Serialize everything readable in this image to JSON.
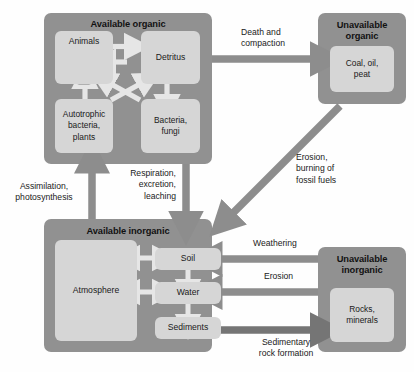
{
  "diagram": {
    "colors": {
      "group_fill": "#919191",
      "node_fill": "#d6d6d6",
      "arrow_gray": "#8d8d8d",
      "arrow_light": "#e2e2e2",
      "arrow_dark": "#6e6e6e",
      "text": "#1a1a1a",
      "background": "#fefefe"
    },
    "groups": [
      {
        "id": "available-organic",
        "title": "Available organic",
        "nodes": [
          {
            "id": "animals",
            "label": "Animals",
            "has_loop_arrow": true
          },
          {
            "id": "detritus",
            "label": "Detritus"
          },
          {
            "id": "autotrophic",
            "label": "Autotrophic\nbacteria,\nplants"
          },
          {
            "id": "bacteria-fungi",
            "label": "Bacteria,\nfungi"
          }
        ]
      },
      {
        "id": "unavailable-organic",
        "title": "Unavailable\norganic",
        "nodes": [
          {
            "id": "coal-oil-peat",
            "label": "Coal, oil,\npeat"
          }
        ]
      },
      {
        "id": "available-inorganic",
        "title": "Available inorganic",
        "nodes": [
          {
            "id": "atmosphere",
            "label": "Atmosphere"
          },
          {
            "id": "soil",
            "label": "Soil"
          },
          {
            "id": "water",
            "label": "Water"
          },
          {
            "id": "sediments",
            "label": "Sediments"
          }
        ]
      },
      {
        "id": "unavailable-inorganic",
        "title": "Unavailable\ninorganic",
        "nodes": [
          {
            "id": "rocks-minerals",
            "label": "Rocks,\nminerals"
          }
        ]
      }
    ],
    "flow_labels": [
      {
        "id": "death-and-compaction",
        "text": "Death and\ncompaction"
      },
      {
        "id": "erosion-burning-fossil-fuels",
        "text": "Erosion,\nburning of\nfossil fuels"
      },
      {
        "id": "assimilation-photosynthesis",
        "text": "Assimilation,\nphotosynthesis"
      },
      {
        "id": "respiration-excretion-leaching",
        "text": "Respiration,\nexcretion,\nleaching"
      },
      {
        "id": "weathering",
        "text": "Weathering"
      },
      {
        "id": "erosion",
        "text": "Erosion"
      },
      {
        "id": "sedimentary-rock-formation",
        "text": "Sedimentary\nrock formation"
      }
    ]
  }
}
